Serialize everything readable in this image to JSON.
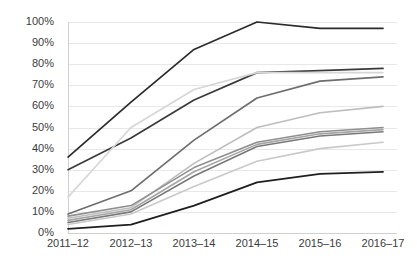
{
  "chart_data": {
    "type": "line",
    "title": "",
    "subtitle": "",
    "xlabel": "",
    "ylabel": "",
    "categories": [
      "2011–12",
      "2012–13",
      "2013–14",
      "2014–15",
      "2015–16",
      "2016–17"
    ],
    "x": [
      "2011–12",
      "2012–13",
      "2013–14",
      "2014–15",
      "2015–16",
      "2016–17"
    ],
    "ylim": [
      0,
      100
    ],
    "ytick_labels": [
      "0%",
      "10%",
      "20%",
      "30%",
      "40%",
      "50%",
      "60%",
      "70%",
      "80%",
      "90%",
      "100%"
    ],
    "ytick_values": [
      0,
      10,
      20,
      30,
      40,
      50,
      60,
      70,
      80,
      90,
      100
    ],
    "grid": "horizontal",
    "legend": "none",
    "series": [
      {
        "name": "series-1",
        "color": "#2b2b2b",
        "width": 1.7,
        "values": [
          36,
          62,
          87,
          100,
          97,
          97
        ]
      },
      {
        "name": "series-2",
        "color": "#3a3a3a",
        "width": 1.7,
        "values": [
          30,
          45,
          63,
          76,
          77,
          78
        ]
      },
      {
        "name": "series-3",
        "color": "#6e6e6e",
        "width": 1.7,
        "values": [
          9,
          20,
          44,
          64,
          72,
          74
        ]
      },
      {
        "name": "series-4",
        "color": "#d6d6d6",
        "width": 1.6,
        "values": [
          17,
          50,
          68,
          76,
          76,
          76
        ]
      },
      {
        "name": "series-5",
        "color": "#bdbdbd",
        "width": 1.6,
        "values": [
          7,
          12,
          33,
          50,
          57,
          60
        ]
      },
      {
        "name": "series-6",
        "color": "#8f8f8f",
        "width": 1.6,
        "values": [
          8,
          13,
          31,
          43,
          48,
          50
        ]
      },
      {
        "name": "series-7",
        "color": "#a5a5a5",
        "width": 1.6,
        "values": [
          6,
          11,
          29,
          42,
          47,
          49
        ]
      },
      {
        "name": "series-8",
        "color": "#787878",
        "width": 1.6,
        "values": [
          5,
          10,
          27,
          41,
          46,
          48
        ]
      },
      {
        "name": "series-9",
        "color": "#c9c9c9",
        "width": 1.6,
        "values": [
          4,
          9,
          22,
          34,
          40,
          43
        ]
      },
      {
        "name": "series-10",
        "color": "#1f1f1f",
        "width": 1.8,
        "values": [
          2,
          4,
          13,
          24,
          28,
          29
        ]
      }
    ]
  },
  "axes": {
    "y_labels": [
      "100%",
      "90%",
      "80%",
      "70%",
      "60%",
      "50%",
      "40%",
      "30%",
      "20%",
      "10%",
      "0%"
    ],
    "x_labels": [
      "2011–12",
      "2012–13",
      "2013–14",
      "2014–15",
      "2015–16",
      "2016–17"
    ]
  },
  "style": {
    "grid_color": "#e8e8e8",
    "axis_color": "#d0d0d0",
    "text_color": "#3c3c3c",
    "background": "#ffffff"
  }
}
